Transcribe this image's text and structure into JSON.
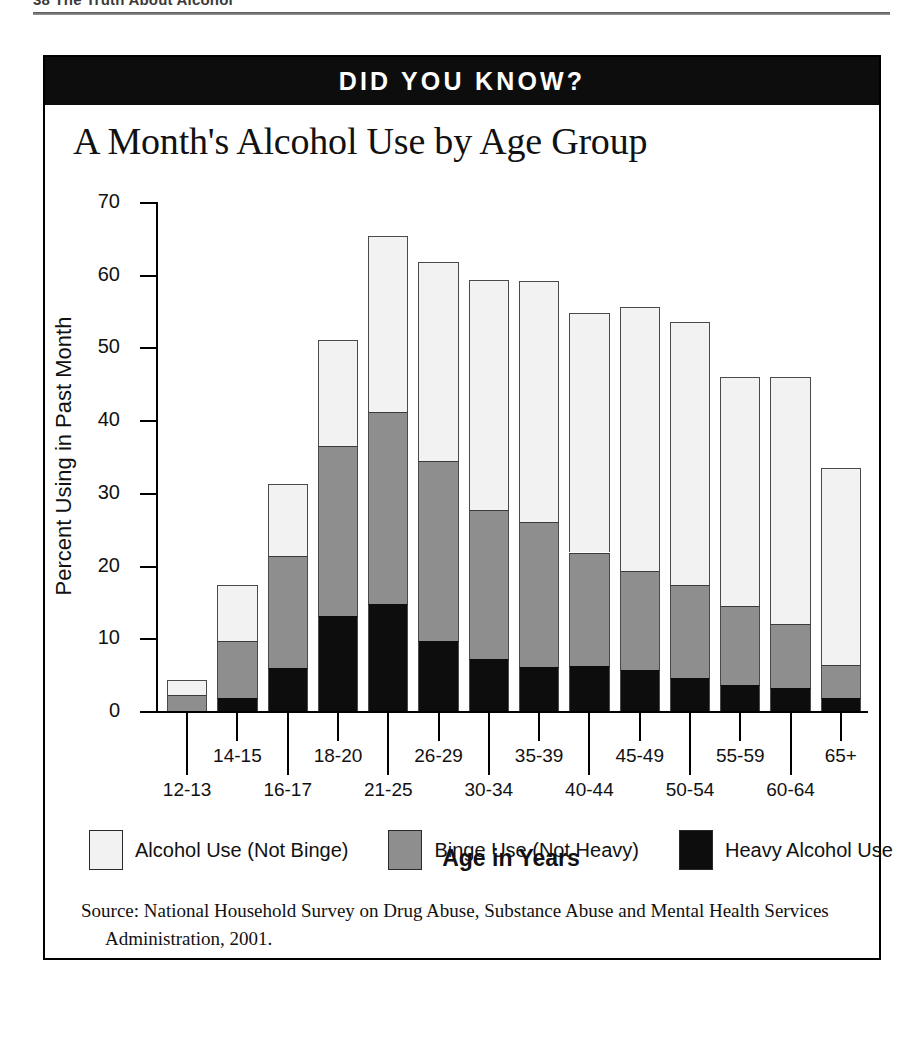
{
  "running_head": {
    "text": "38  The Truth About Alcohol"
  },
  "banner": {
    "title": "DID YOU KNOW?"
  },
  "chart_data": {
    "type": "bar",
    "subtype": "stacked-bar",
    "title": "A Month's Alcohol Use by Age Group",
    "xlabel": "Age in Years",
    "ylabel": "Percent Using in Past Month",
    "ylim": [
      0,
      70
    ],
    "yticks": [
      0,
      10,
      20,
      30,
      40,
      50,
      60,
      70
    ],
    "grid": false,
    "legend_position": "bottom",
    "categories": [
      "12-13",
      "14-15",
      "16-17",
      "18-20",
      "21-25",
      "26-29",
      "30-34",
      "35-39",
      "40-44",
      "45-49",
      "50-54",
      "55-59",
      "60-64",
      "65+"
    ],
    "series": [
      {
        "name": "Heavy Alcohol Use",
        "color": "#0d0d0d",
        "values": [
          0.0,
          1.8,
          5.9,
          13.1,
          14.7,
          9.6,
          7.1,
          6.1,
          6.2,
          5.6,
          4.5,
          3.6,
          3.1,
          1.8
        ]
      },
      {
        "name": "Binge Use (Not Heavy)",
        "color": "#8e8e8e",
        "values": [
          2.2,
          7.8,
          15.4,
          23.3,
          26.4,
          24.8,
          20.5,
          19.9,
          15.6,
          13.7,
          12.8,
          10.9,
          8.8,
          4.5
        ]
      },
      {
        "name": "Alcohol Use (Not Binge)",
        "color": "#f2f2f2",
        "values": [
          2.1,
          7.7,
          9.9,
          14.6,
          24.2,
          27.3,
          31.7,
          33.1,
          32.9,
          36.3,
          36.2,
          31.5,
          34.1,
          27.1
        ]
      }
    ],
    "cumulative_tops": {
      "heavy": [
        0.0,
        1.8,
        5.9,
        13.1,
        14.7,
        9.6,
        7.1,
        6.1,
        6.2,
        5.6,
        4.5,
        3.6,
        3.1,
        1.8
      ],
      "binge": [
        2.2,
        9.6,
        21.3,
        36.4,
        41.1,
        34.4,
        27.6,
        26.0,
        21.8,
        19.3,
        17.3,
        14.5,
        11.9,
        6.3
      ],
      "total": [
        4.3,
        17.3,
        31.2,
        51.0,
        65.3,
        61.7,
        59.3,
        59.1,
        54.7,
        55.6,
        53.5,
        46.0,
        46.0,
        33.4
      ]
    }
  },
  "legend": {
    "items": [
      {
        "label": "Alcohol Use (Not Binge)",
        "swatch": "white"
      },
      {
        "label": "Binge Use (Not Heavy)",
        "swatch": "gray"
      },
      {
        "label": "Heavy Alcohol Use",
        "swatch": "black"
      }
    ]
  },
  "source": {
    "line1": "Source:  National Household Survey on Drug Abuse, Substance Abuse and Mental Health Services",
    "line2": "Administration, 2001."
  }
}
